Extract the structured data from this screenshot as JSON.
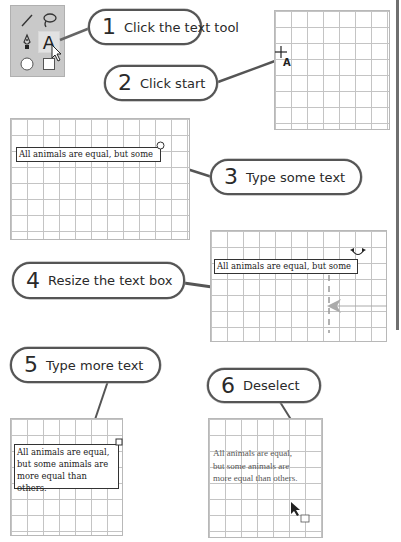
{
  "toolbar": {
    "tools": [
      {
        "name": "line-tool",
        "icon": "line-icon"
      },
      {
        "name": "lasso-tool",
        "icon": "lasso-icon"
      },
      {
        "name": "pen-tool",
        "icon": "pen-icon"
      },
      {
        "name": "text-tool",
        "icon": "text-a-icon",
        "glyph": "A",
        "selected": true
      },
      {
        "name": "ellipse-tool",
        "icon": "circle-icon"
      },
      {
        "name": "rectangle-tool",
        "icon": "square-icon"
      }
    ]
  },
  "steps": [
    {
      "number": "1",
      "label": "Click the text tool"
    },
    {
      "number": "2",
      "label": "Click start"
    },
    {
      "number": "3",
      "label": "Type some text"
    },
    {
      "number": "4",
      "label": "Resize the text box"
    },
    {
      "number": "5",
      "label": "Type more text"
    },
    {
      "number": "6",
      "label": "Deselect"
    }
  ],
  "cursor_glyph": "A",
  "text": {
    "single_line": "All animals are equal, but some",
    "lines": [
      "All animals are equal,",
      "but some animals are",
      "more equal than others."
    ]
  },
  "colors": {
    "toolbar_bg": "#c9c9c9",
    "grid_line": "#c4c4c4",
    "callout_border": "#555555",
    "resize_arrow": "#a8a8a8"
  }
}
